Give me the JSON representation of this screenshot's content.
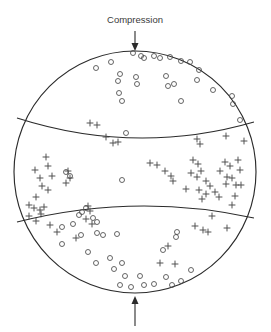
{
  "figure": {
    "type": "focal-mechanism-stereonet",
    "title": "",
    "width": 271,
    "height": 332,
    "background_color": "#ffffff",
    "stroke_color": "#2b2b2b",
    "marker_color": "#4a4a4a"
  },
  "annotations": {
    "top_label": "Compression",
    "top_arrow": {
      "name": "compression-arrow-top",
      "direction": "down",
      "x": 135,
      "y_start": 32,
      "y_end": 51
    },
    "bottom_arrow": {
      "name": "compression-arrow-bottom",
      "direction": "up",
      "x": 135,
      "y_start": 325,
      "y_end": 297
    }
  },
  "chart_data": {
    "type": "scatter",
    "title": "Compression",
    "xlabel": "",
    "ylabel": "",
    "projection": "equal-area lower hemisphere stereonet",
    "primitive_circle": {
      "cx": 135,
      "cy": 172,
      "r": 121
    },
    "nodal_planes": [
      {
        "name": "upper-nodal-plane",
        "left_x": 17,
        "left_y": 118,
        "ctrl_x": 136,
        "ctrl_y": 156,
        "right_x": 254,
        "right_y": 122
      },
      {
        "name": "lower-nodal-plane",
        "left_x": 17,
        "left_y": 222,
        "ctrl_x": 136,
        "ctrl_y": 192,
        "right_x": 254,
        "right_y": 218
      }
    ],
    "legend": [
      {
        "symbol": "circle",
        "meaning": "dilatational first motion"
      },
      {
        "symbol": "plus",
        "meaning": "compressional first motion"
      }
    ],
    "series": [
      {
        "name": "dilatation-circles",
        "symbol": "circle",
        "count": 60,
        "points": [
          [
            133,
            53
          ],
          [
            141,
            56
          ],
          [
            144,
            58
          ],
          [
            154,
            56
          ],
          [
            160,
            58
          ],
          [
            170,
            57
          ],
          [
            181,
            61
          ],
          [
            190,
            62
          ],
          [
            111,
            62
          ],
          [
            96,
            68
          ],
          [
            120,
            74
          ],
          [
            118,
            81
          ],
          [
            136,
            77
          ],
          [
            137,
            84
          ],
          [
            166,
            76
          ],
          [
            199,
            70
          ],
          [
            197,
            80
          ],
          [
            174,
            84
          ],
          [
            168,
            86
          ],
          [
            213,
            90
          ],
          [
            232,
            96
          ],
          [
            233,
            104
          ],
          [
            119,
            93
          ],
          [
            122,
            101
          ],
          [
            181,
            101
          ],
          [
            240,
            120
          ],
          [
            126,
            133
          ],
          [
            122,
            180
          ],
          [
            66,
            172
          ],
          [
            70,
            176
          ],
          [
            86,
            208
          ],
          [
            82,
            212
          ],
          [
            79,
            215
          ],
          [
            93,
            218
          ],
          [
            97,
            222
          ],
          [
            73,
            224
          ],
          [
            62,
            227
          ],
          [
            81,
            235
          ],
          [
            97,
            233
          ],
          [
            103,
            235
          ],
          [
            117,
            234
          ],
          [
            177,
            232
          ],
          [
            176,
            237
          ],
          [
            62,
            244
          ],
          [
            88,
            252
          ],
          [
            96,
            263
          ],
          [
            110,
            258
          ],
          [
            114,
            269
          ],
          [
            122,
            263
          ],
          [
            125,
            276
          ],
          [
            140,
            276
          ],
          [
            144,
            285
          ],
          [
            154,
            284
          ],
          [
            131,
            287
          ],
          [
            120,
            285
          ],
          [
            166,
            277
          ],
          [
            172,
            285
          ],
          [
            181,
            281
          ],
          [
            191,
            270
          ],
          [
            163,
            250
          ]
        ]
      },
      {
        "name": "compression-plusses",
        "symbol": "plus",
        "count": 72,
        "points": [
          [
            90,
            123
          ],
          [
            97,
            125
          ],
          [
            106,
            137
          ],
          [
            118,
            142
          ],
          [
            113,
            143
          ],
          [
            197,
            139
          ],
          [
            200,
            144
          ],
          [
            226,
            136
          ],
          [
            244,
            141
          ],
          [
            46,
            157
          ],
          [
            48,
            166
          ],
          [
            35,
            170
          ],
          [
            52,
            176
          ],
          [
            40,
            178
          ],
          [
            42,
            186
          ],
          [
            48,
            190
          ],
          [
            36,
            197
          ],
          [
            29,
            205
          ],
          [
            34,
            208
          ],
          [
            40,
            210
          ],
          [
            44,
            207
          ],
          [
            41,
            214
          ],
          [
            29,
            216
          ],
          [
            36,
            221
          ],
          [
            50,
            225
          ],
          [
            68,
            171
          ],
          [
            70,
            178
          ],
          [
            66,
            183
          ],
          [
            88,
            206
          ],
          [
            90,
            211
          ],
          [
            86,
            219
          ],
          [
            92,
            224
          ],
          [
            150,
            163
          ],
          [
            157,
            165
          ],
          [
            165,
            171
          ],
          [
            171,
            176
          ],
          [
            173,
            181
          ],
          [
            193,
            160
          ],
          [
            198,
            164
          ],
          [
            201,
            171
          ],
          [
            191,
            173
          ],
          [
            197,
            177
          ],
          [
            206,
            181
          ],
          [
            210,
            186
          ],
          [
            186,
            189
          ],
          [
            199,
            190
          ],
          [
            206,
            194
          ],
          [
            202,
            199
          ],
          [
            225,
            162
          ],
          [
            230,
            166
          ],
          [
            220,
            171
          ],
          [
            227,
            177
          ],
          [
            232,
            178
          ],
          [
            240,
            170
          ],
          [
            226,
            184
          ],
          [
            236,
            185
          ],
          [
            241,
            185
          ],
          [
            215,
            192
          ],
          [
            219,
            197
          ],
          [
            232,
            205
          ],
          [
            212,
            216
          ],
          [
            195,
            226
          ],
          [
            203,
            230
          ],
          [
            208,
            232
          ],
          [
            227,
            228
          ],
          [
            168,
            246
          ],
          [
            160,
            263
          ],
          [
            175,
            264
          ],
          [
            238,
            160
          ],
          [
            235,
            196
          ],
          [
            57,
            232
          ],
          [
            76,
            238
          ]
        ]
      }
    ]
  }
}
